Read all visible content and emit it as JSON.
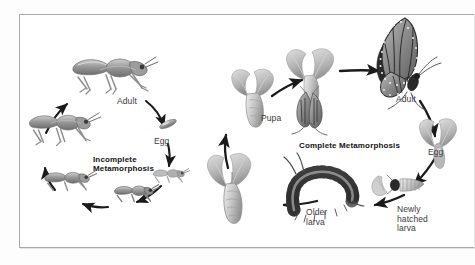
{
  "figure": {
    "background_color": "#ffffff",
    "frame_color": "#a9a9a9",
    "text_color": "#3a3a3a",
    "heading_color": "#121212"
  },
  "diagrams": [
    {
      "id": "incomplete",
      "heading_line1": "Incomplete",
      "heading_line2": "Metamorphosis",
      "organism": "grasshopper",
      "cycle_direction": "clockwise",
      "stages": [
        {
          "label": "Adult",
          "stage_name": "adult-grasshopper"
        },
        {
          "label": "Egg",
          "stage_name": "egg"
        },
        {
          "label": "",
          "stage_name": "nymph-first-instar"
        },
        {
          "label": "",
          "stage_name": "nymph-second-instar"
        },
        {
          "label": "",
          "stage_name": "nymph-third-instar"
        },
        {
          "label": "",
          "stage_name": "nymph-fourth-instar"
        }
      ]
    },
    {
      "id": "complete",
      "heading_line1": "Complete Metamorphosis",
      "heading_line2": "",
      "organism": "butterfly",
      "cycle_direction": "counterclockwise",
      "stages": [
        {
          "label": "Pupa",
          "stage_name": "pupa-chrysalis"
        },
        {
          "label": "",
          "stage_name": "emerging-adult"
        },
        {
          "label": "Adult",
          "stage_name": "adult-butterfly"
        },
        {
          "label": "Egg",
          "stage_name": "egg-on-leaf"
        },
        {
          "label": "Newly\nhatched\nlarva",
          "stage_name": "newly-hatched-larva"
        },
        {
          "label": "Older\nlarva",
          "stage_name": "older-larva"
        }
      ]
    }
  ]
}
